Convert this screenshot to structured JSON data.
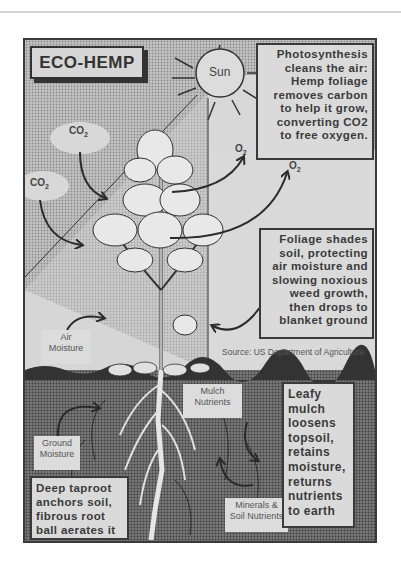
{
  "page": {
    "title": "ECO-HEMP"
  },
  "poster": {
    "title": "ECO-HEMP",
    "sun_label": "Sun",
    "co2_labels": [
      "CO2",
      "CO2"
    ],
    "o2_labels": [
      "O2",
      "O2"
    ],
    "photosynthesis_text": "Photosynthesis cleans the air: Hemp foliage removes carbon to help it grow, converting CO2 to free oxygen.",
    "photosynthesis_lines": [
      "Photosynthesis",
      "cleans the air:",
      "Hemp foliage",
      "removes carbon",
      "to help it grow,",
      "converting CO2",
      "to free oxygen."
    ],
    "foliage_lines": [
      "Foliage shades",
      "soil, protecting",
      "air moisture and",
      "slowing noxious",
      "weed growth,",
      "then drops to",
      "blanket ground"
    ],
    "source": "Source: US Department of Agriculture",
    "air_moisture": [
      "Air",
      "Moisture"
    ],
    "mulch_nutrients": [
      "Mulch",
      "Nutrients"
    ],
    "ground_moisture": [
      "Ground",
      "Moisture"
    ],
    "minerals": [
      "Minerals &",
      "Soil Nutrients"
    ],
    "leafy_mulch_lines": [
      "Leafy",
      "mulch",
      "loosens",
      "topsoil,",
      "retains",
      "moisture,",
      "returns",
      "nutrients",
      "to earth"
    ],
    "taproot_lines": [
      "Deep taproot",
      "anchors soil,",
      "fibrous root",
      "ball aerates it"
    ]
  },
  "colors": {
    "frame": "#3a3a3a",
    "sky_light": "#d8d8d8",
    "sky_dotted": "#b8b8b8",
    "soil": "#6e6e6e",
    "box_bg": "#dadada",
    "text": "#3a3a3a"
  }
}
